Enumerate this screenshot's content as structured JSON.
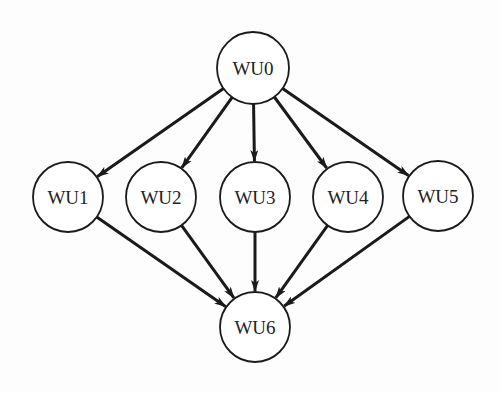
{
  "diagram": {
    "type": "dag",
    "colors": {
      "stroke": "#1a1a1a",
      "background": "#fdfdfd",
      "node_fill": "#ffffff"
    },
    "nodes": [
      {
        "id": "WU0",
        "label": "WU0",
        "cx": 253,
        "cy": 68,
        "r": 36
      },
      {
        "id": "WU1",
        "label": "WU1",
        "cx": 68,
        "cy": 197,
        "r": 35
      },
      {
        "id": "WU2",
        "label": "WU2",
        "cx": 161,
        "cy": 197,
        "r": 35
      },
      {
        "id": "WU3",
        "label": "WU3",
        "cx": 255,
        "cy": 197,
        "r": 35
      },
      {
        "id": "WU4",
        "label": "WU4",
        "cx": 348,
        "cy": 197,
        "r": 35
      },
      {
        "id": "WU5",
        "label": "WU5",
        "cx": 438,
        "cy": 196,
        "r": 35
      },
      {
        "id": "WU6",
        "label": "WU6",
        "cx": 255,
        "cy": 327,
        "r": 35
      }
    ],
    "edges": [
      {
        "from": "WU0",
        "to": "WU1"
      },
      {
        "from": "WU0",
        "to": "WU2"
      },
      {
        "from": "WU0",
        "to": "WU3"
      },
      {
        "from": "WU0",
        "to": "WU4"
      },
      {
        "from": "WU0",
        "to": "WU5"
      },
      {
        "from": "WU1",
        "to": "WU6"
      },
      {
        "from": "WU2",
        "to": "WU6"
      },
      {
        "from": "WU3",
        "to": "WU6"
      },
      {
        "from": "WU4",
        "to": "WU6"
      },
      {
        "from": "WU5",
        "to": "WU6"
      }
    ]
  }
}
